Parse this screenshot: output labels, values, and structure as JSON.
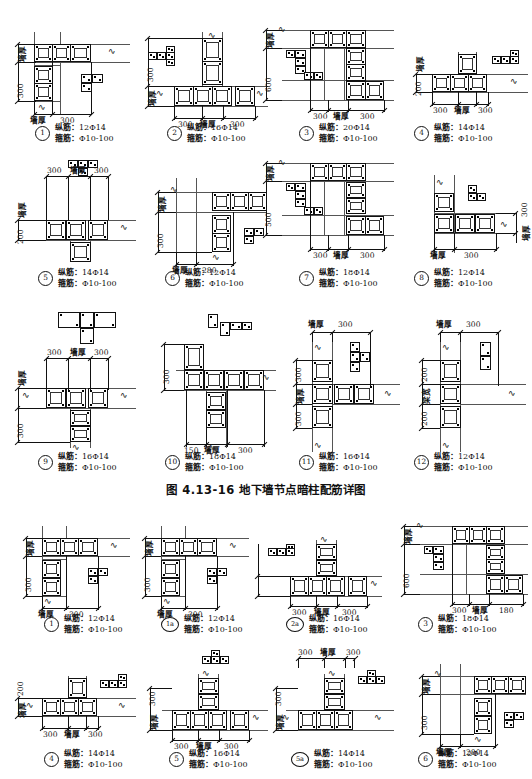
{
  "document": {
    "type": "engineering-drawing",
    "caption": "图 4.13-16   地下墙节点暗柱配筋详图",
    "caption_figure_no": "图 4.13-16",
    "caption_title": "地下墙节点暗柱配筋详图",
    "page_background": "#ffffff",
    "line_color": "#111111"
  },
  "labels": {
    "wall_thickness": "墙厚",
    "beam_width": "梁宽",
    "longitudinal_label": "纵筋：",
    "stirrup_label": "箍筋：",
    "rebar_symbol": "Φ"
  },
  "upper_group": {
    "rows": [
      {
        "details": [
          {
            "id": "1",
            "tag": "1",
            "shape": "L-corner",
            "longitudinal": "12Φ14",
            "stirrup": "Φ10-100",
            "dims": {
              "left_vertical": [
                "墙厚",
                "300"
              ],
              "bottom_horizontal": [
                "墙厚",
                "300"
              ]
            }
          },
          {
            "id": "2",
            "tag": "2",
            "shape": "T-junction",
            "longitudinal": "16Φ14",
            "stirrup": "Φ10-100",
            "dims": {
              "left_vertical": [
                "300",
                "墙厚"
              ],
              "bottom_horizontal": [
                "300",
                "墙厚",
                "300"
              ]
            }
          },
          {
            "id": "3",
            "tag": "3",
            "shape": "Z-offset",
            "longitudinal": "20Φ14",
            "stirrup": "Φ10-100",
            "dims": {
              "left_vertical": [
                "墙厚",
                "600"
              ],
              "bottom_horizontal": [
                "300",
                "墙厚",
                "300"
              ]
            }
          },
          {
            "id": "4",
            "tag": "4",
            "shape": "T-junction-shallow",
            "longitudinal": "14Φ14",
            "stirrup": "Φ10-100",
            "dims": {
              "left_vertical": [
                "墙厚",
                "200"
              ],
              "bottom_horizontal": [
                "300",
                "墙厚",
                "300"
              ]
            }
          }
        ]
      },
      {
        "details": [
          {
            "id": "5",
            "tag": "5",
            "shape": "T-junction-down",
            "longitudinal": "14Φ14",
            "stirrup": "Φ10-100",
            "dims": {
              "left_vertical": [
                "墙厚",
                "200"
              ],
              "top_horizontal": [
                "300",
                "墙厚",
                "300"
              ]
            }
          },
          {
            "id": "6",
            "tag": "6",
            "shape": "L-corner",
            "longitudinal": "12Φ14",
            "stirrup": "Φ10-100",
            "dims": {
              "left_vertical": [
                "墙厚",
                "300"
              ],
              "bottom_horizontal": [
                "墙厚",
                "280"
              ]
            }
          },
          {
            "id": "7",
            "tag": "7",
            "shape": "Z-offset",
            "longitudinal": "18Φ14",
            "stirrup": "Φ10-100",
            "dims": {
              "left_vertical": [
                "墙厚",
                "500"
              ],
              "bottom_horizontal": [
                "300",
                "墙厚",
                "300"
              ]
            }
          },
          {
            "id": "8",
            "tag": "8",
            "shape": "L-corner-right",
            "longitudinal": "12Φ14",
            "stirrup": "Φ10-100",
            "dims": {
              "right_vertical": [
                "墙厚",
                "300"
              ],
              "bottom_horizontal": [
                "墙厚",
                "300"
              ]
            }
          }
        ]
      },
      {
        "details": [
          {
            "id": "9",
            "tag": "9",
            "shape": "T-junction-down",
            "longitudinal": "16Φ14",
            "stirrup": "Φ10-100",
            "dims": {
              "left_vertical": [
                "墙厚",
                "300"
              ],
              "top_horizontal": [
                "300",
                "墙厚",
                "300"
              ]
            }
          },
          {
            "id": "10",
            "tag": "10",
            "shape": "T-junction-side",
            "longitudinal": "18Φ14",
            "stirrup": "Φ10-100",
            "dims": {
              "left_vertical": [
                "300"
              ],
              "bottom_horizontal": [
                "150",
                "墙厚",
                "300"
              ]
            }
          },
          {
            "id": "11",
            "tag": "11",
            "shape": "T-junction-right",
            "longitudinal": "16Φ14",
            "stirrup": "Φ10-100",
            "dims": {
              "left_vertical": [
                "300",
                "墙厚",
                "300"
              ],
              "top_horizontal": [
                "墙厚",
                "300"
              ]
            }
          },
          {
            "id": "12",
            "tag": "12",
            "shape": "wall-beam-joint",
            "longitudinal": "12Φ14",
            "stirrup": "Φ10-100",
            "dims": {
              "left_vertical": [
                "200",
                "梁宽",
                "200"
              ],
              "top_horizontal": [
                "墙厚",
                "300"
              ]
            }
          }
        ]
      }
    ]
  },
  "lower_group": {
    "rows": [
      {
        "details": [
          {
            "id": "1b",
            "tag": "1",
            "shape": "L-corner",
            "longitudinal": "12Φ14",
            "stirrup": "Φ10-100",
            "dims": {
              "left_vertical": [
                "墙厚",
                "300"
              ],
              "bottom_horizontal": [
                "墙厚",
                "300"
              ]
            }
          },
          {
            "id": "1a",
            "tag": "1a",
            "shape": "L-corner",
            "longitudinal": "12Φ14",
            "stirrup": "Φ10-100",
            "dims": {
              "left_vertical": [
                "墙厚",
                "300"
              ],
              "bottom_horizontal": [
                "墙厚",
                "300"
              ]
            }
          },
          {
            "id": "2a",
            "tag": "2a",
            "shape": "T-junction",
            "longitudinal": "16Φ14",
            "stirrup": "Φ10-100",
            "dims": {
              "left_vertical": [
                "墙厚",
                "300"
              ],
              "bottom_horizontal": [
                "300",
                "墙厚",
                "300"
              ]
            }
          },
          {
            "id": "3b",
            "tag": "3",
            "shape": "Z-offset",
            "longitudinal": "18Φ14",
            "stirrup": "Φ10-100",
            "dims": {
              "left_vertical": [
                "墙厚",
                "600"
              ],
              "bottom_horizontal": [
                "300",
                "墙厚",
                "180"
              ]
            }
          }
        ]
      },
      {
        "details": [
          {
            "id": "4b",
            "tag": "4",
            "shape": "T-junction-up",
            "longitudinal": "14Φ14",
            "stirrup": "Φ10-100",
            "dims": {
              "left_vertical": [
                "墙厚",
                "200"
              ],
              "bottom_horizontal": [
                "300",
                "墙厚",
                "300"
              ]
            }
          },
          {
            "id": "5b",
            "tag": "5",
            "shape": "T-junction-up",
            "longitudinal": "16Φ14",
            "stirrup": "Φ10-100",
            "dims": {
              "left_vertical": [
                "墙厚",
                "300"
              ],
              "bottom_horizontal": [
                "300",
                "墙厚",
                "300"
              ]
            }
          },
          {
            "id": "5a",
            "tag": "5a",
            "shape": "T-junction-up",
            "longitudinal": "14Φ14",
            "stirrup": "Φ10-100",
            "dims": {
              "left_vertical": [
                "墙厚",
                "300"
              ],
              "top_horizontal": [
                "300",
                "墙厚",
                "300"
              ]
            }
          },
          {
            "id": "6b",
            "tag": "6",
            "shape": "L-corner",
            "longitudinal": "12Φ14",
            "stirrup": "Φ10-100",
            "dims": {
              "left_vertical": [
                "墙厚",
                "300"
              ],
              "bottom_horizontal": [
                "墙厚",
                "280"
              ]
            }
          }
        ]
      }
    ]
  }
}
